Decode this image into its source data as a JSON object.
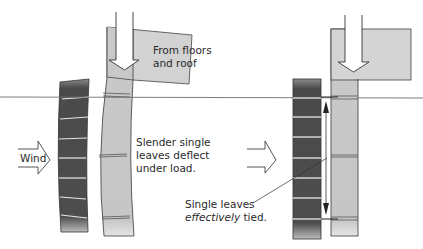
{
  "labels": {
    "load": [
      "From floors",
      "and roof"
    ],
    "deflect": [
      "Slender single",
      "leaves deflect",
      "under load."
    ],
    "tied_line1": "Single leaves",
    "tied_emph": "effectively",
    "tied_rest": " tied.",
    "wind": "Wind"
  },
  "colors": {
    "dark_leaf": "#4d4d4d",
    "light_leaf": "#c9c9c9",
    "slab": "#d3d3d3",
    "outline": "#3a3a3a",
    "mortar": "#e6e6e6",
    "ground_line": "#6a6a6a"
  }
}
